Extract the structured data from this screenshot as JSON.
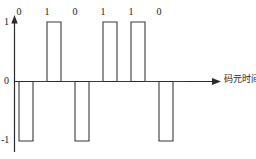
{
  "chart_data": {
    "type": "line",
    "title": "",
    "subtitle": "",
    "xlabel": "码元时间",
    "ylabel": "",
    "grid": false,
    "legend": null,
    "encoding": "bipolar return-to-zero (RZ)",
    "bits": [
      "0",
      "1",
      "0",
      "1",
      "1",
      "0"
    ],
    "bit_levels": [
      -1,
      1,
      -1,
      1,
      1,
      -1
    ],
    "duty_cycle": 0.5,
    "ytick_labels": [
      "1",
      "0",
      "-1"
    ],
    "ytick_values": [
      1,
      0,
      -1
    ],
    "ylim": [
      -1.15,
      1.15
    ],
    "xlim": [
      0,
      7.2
    ],
    "x_axis_arrow": true,
    "y_axis_arrow": true,
    "waveform_points": [
      {
        "t": 0.0,
        "v": 0
      },
      {
        "t": 0.0,
        "v": -1
      },
      {
        "t": 0.5,
        "v": -1
      },
      {
        "t": 0.5,
        "v": 0
      },
      {
        "t": 1.0,
        "v": 0
      },
      {
        "t": 1.0,
        "v": 1
      },
      {
        "t": 1.5,
        "v": 1
      },
      {
        "t": 1.5,
        "v": 0
      },
      {
        "t": 2.0,
        "v": 0
      },
      {
        "t": 2.0,
        "v": -1
      },
      {
        "t": 2.5,
        "v": -1
      },
      {
        "t": 2.5,
        "v": 0
      },
      {
        "t": 3.0,
        "v": 0
      },
      {
        "t": 3.0,
        "v": 1
      },
      {
        "t": 3.5,
        "v": 1
      },
      {
        "t": 3.5,
        "v": 0
      },
      {
        "t": 4.0,
        "v": 0
      },
      {
        "t": 4.0,
        "v": 1
      },
      {
        "t": 4.5,
        "v": 1
      },
      {
        "t": 4.5,
        "v": 0
      },
      {
        "t": 5.0,
        "v": 0
      },
      {
        "t": 5.0,
        "v": -1
      },
      {
        "t": 5.5,
        "v": -1
      },
      {
        "t": 5.5,
        "v": 0
      },
      {
        "t": 6.0,
        "v": 0
      }
    ]
  },
  "axis": {
    "y_top_label": "1",
    "y_zero_label": "0",
    "y_bottom_label": "-1",
    "x_label": "码元时间"
  },
  "bit_labels": [
    "0",
    "1",
    "0",
    "1",
    "1",
    "0"
  ],
  "colors": {
    "stroke": "#3a3a3a",
    "axis": "#2b2b2b",
    "text": "#1a1a1a",
    "background": "#ffffff"
  }
}
